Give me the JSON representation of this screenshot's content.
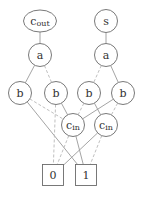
{
  "diagram": {
    "type": "binary decision diagram",
    "nodes": [
      {
        "id": "cout",
        "label": "c",
        "sub": "out",
        "shape": "ellipse",
        "x": 40,
        "y": 21
      },
      {
        "id": "s",
        "label": "s",
        "sub": "",
        "shape": "circle",
        "x": 106,
        "y": 21
      },
      {
        "id": "a1",
        "label": "a",
        "sub": "",
        "shape": "circle",
        "x": 40,
        "y": 55
      },
      {
        "id": "a2",
        "label": "a",
        "sub": "",
        "shape": "circle",
        "x": 106,
        "y": 55
      },
      {
        "id": "b1",
        "label": "b",
        "sub": "",
        "shape": "circle",
        "x": 20,
        "y": 93
      },
      {
        "id": "b2",
        "label": "b",
        "sub": "",
        "shape": "circle",
        "x": 56,
        "y": 93
      },
      {
        "id": "b3",
        "label": "b",
        "sub": "",
        "shape": "circle",
        "x": 89,
        "y": 93
      },
      {
        "id": "b4",
        "label": "b",
        "sub": "",
        "shape": "circle",
        "x": 123,
        "y": 93
      },
      {
        "id": "cin1",
        "label": "c",
        "sub": "in",
        "shape": "circle",
        "x": 73,
        "y": 125
      },
      {
        "id": "cin2",
        "label": "c",
        "sub": "in",
        "shape": "circle",
        "x": 106,
        "y": 125
      },
      {
        "id": "t0",
        "label": "0",
        "sub": "",
        "shape": "box",
        "x": 53,
        "y": 175
      },
      {
        "id": "t1",
        "label": "1",
        "sub": "",
        "shape": "box",
        "x": 86,
        "y": 175
      }
    ],
    "edges": [
      {
        "from": "cout",
        "to": "a1",
        "style": "solid"
      },
      {
        "from": "s",
        "to": "a2",
        "style": "solid"
      },
      {
        "from": "a1",
        "to": "b1",
        "style": "solid"
      },
      {
        "from": "a1",
        "to": "b2",
        "style": "dashed"
      },
      {
        "from": "a2",
        "to": "b3",
        "style": "dashed"
      },
      {
        "from": "a2",
        "to": "b4",
        "style": "solid"
      },
      {
        "from": "b1",
        "to": "t1",
        "style": "solid"
      },
      {
        "from": "b1",
        "to": "cin1",
        "style": "dashed"
      },
      {
        "from": "b2",
        "to": "cin1",
        "style": "solid"
      },
      {
        "from": "b2",
        "to": "t0",
        "style": "dashed"
      },
      {
        "from": "b3",
        "to": "cin2",
        "style": "solid"
      },
      {
        "from": "b3",
        "to": "cin1",
        "style": "dashed"
      },
      {
        "from": "b4",
        "to": "cin1",
        "style": "solid"
      },
      {
        "from": "b4",
        "to": "cin2",
        "style": "dashed"
      },
      {
        "from": "cin1",
        "to": "t1",
        "style": "solid"
      },
      {
        "from": "cin1",
        "to": "t0",
        "style": "dashed"
      },
      {
        "from": "cin2",
        "to": "t0",
        "style": "solid"
      },
      {
        "from": "cin2",
        "to": "t1",
        "style": "dashed"
      }
    ]
  }
}
